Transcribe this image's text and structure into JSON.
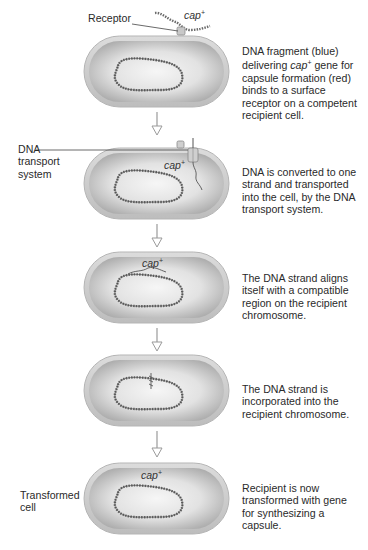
{
  "labels": {
    "receptor": "Receptor",
    "dna_transport_line1": "DNA",
    "dna_transport_line2": "transport",
    "dna_transport_line3": "system",
    "transformed_line1": "Transformed",
    "transformed_line2": "cell"
  },
  "gene": {
    "name": "cap",
    "superscript": "+"
  },
  "steps": [
    {
      "lines": [
        "DNA fragment (blue)",
        "delivering cap⁺ gene for",
        "capsule formation (red)",
        "binds to a surface",
        "receptor on a competent",
        "recipient cell."
      ]
    },
    {
      "lines": [
        "DNA is converted to one",
        "strand and transported",
        "into the cell, by the DNA",
        "transport system."
      ]
    },
    {
      "lines": [
        "The DNA strand aligns",
        "itself with a compatible",
        "region on the recipient",
        "chromosome."
      ]
    },
    {
      "lines": [
        "The DNA strand is",
        "incorporated into the",
        "recipient chromosome."
      ]
    },
    {
      "lines": [
        "Recipient is now",
        "transformed with gene",
        "for synthesizing a",
        "capsule."
      ]
    }
  ],
  "colors": {
    "cell_outer": "#cfcfcf",
    "cell_inner": "#b9b9b9",
    "cell_highlight": "#f2f2f2",
    "dna": "#555555",
    "arrow": "#9a9a9a",
    "text": "#2a2a2a"
  }
}
